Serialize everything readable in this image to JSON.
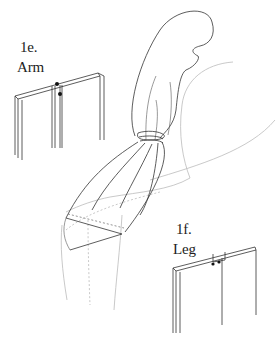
{
  "figure": {
    "labels": [
      {
        "id": "arm",
        "number": "1e.",
        "text": "Arm"
      },
      {
        "id": "leg",
        "number": "1f.",
        "text": "Leg"
      }
    ],
    "colors": {
      "background": "#ffffff",
      "line": "#333333",
      "ghost_line": "#bbbbbb",
      "label": "#222222"
    }
  }
}
